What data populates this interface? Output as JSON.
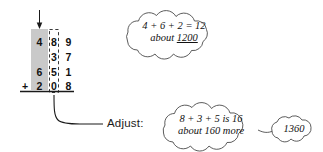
{
  "figure": {
    "type": "addition-estimation-diagram",
    "background_color": "#ffffff",
    "ink_color": "#1a1a1a",
    "highlight_column_color": "#c9c9c9"
  },
  "arrow": {
    "name": "down-arrow",
    "points_to": "hundreds-column"
  },
  "addition": {
    "columns": [
      "hundreds",
      "tens",
      "ones"
    ],
    "rows": [
      {
        "operator": "",
        "digits": [
          "4",
          "8",
          "9"
        ]
      },
      {
        "operator": "",
        "digits": [
          "",
          "3",
          "7"
        ]
      },
      {
        "operator": "",
        "digits": [
          "6",
          "5",
          "1"
        ]
      },
      {
        "operator": "+",
        "digits": [
          "2",
          "0",
          "8"
        ]
      }
    ],
    "highlighted_column_index": 0,
    "dashed_box_column_index": 1,
    "rule_line": true
  },
  "adjust_label": {
    "text": "Adjust:"
  },
  "clouds": [
    {
      "id": "cloud-hundreds",
      "line1": "4 + 6 + 2 = 12",
      "line2_prefix": "about ",
      "line2_value": "1200"
    },
    {
      "id": "cloud-tens",
      "line1": "8 + 3 + 5 is 16",
      "line2_prefix": "about 160 more",
      "line2_value": ""
    }
  ],
  "result_bubble": {
    "value": "1360"
  }
}
